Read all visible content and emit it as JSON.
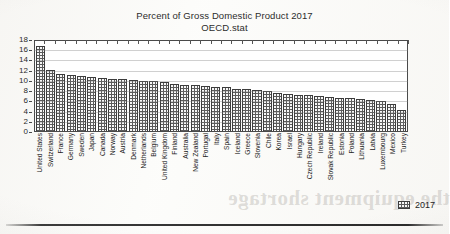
{
  "chart_data": {
    "type": "bar",
    "title": "Percent of Gross Domestic Product 2017",
    "subtitle": "OECD.stat",
    "xlabel": "",
    "ylabel": "",
    "ylim": [
      0,
      18
    ],
    "ytick_step": 2,
    "yticks": [
      18,
      16,
      14,
      12,
      10,
      8,
      6,
      4,
      2,
      0
    ],
    "grid": true,
    "legend": {
      "position": "bottom-right",
      "entries": [
        {
          "name": "2017",
          "color": "#5b5b5b",
          "pattern": "checkered"
        }
      ]
    },
    "categories": [
      "United States",
      "Switzerland",
      "France",
      "Germany",
      "Sweden",
      "Japan",
      "Canada",
      "Norway",
      "Austria",
      "Denmark",
      "Netherlands",
      "Belgium",
      "United Kingdom",
      "Finland",
      "Australia",
      "New Zealand",
      "Portugal",
      "Italy",
      "Spain",
      "Iceland",
      "Greece",
      "Slovenia",
      "Chile",
      "Korea",
      "Israel",
      "Hungary",
      "Czech Republic",
      "Ireland",
      "Slovak Republic",
      "Estonia",
      "Poland",
      "Lithuania",
      "Latvia",
      "Luxembourg",
      "Mexico",
      "Turkey"
    ],
    "series": [
      {
        "name": "2017",
        "values": [
          17.1,
          12.3,
          11.5,
          11.2,
          11.0,
          10.9,
          10.6,
          10.4,
          10.4,
          10.2,
          10.1,
          10.1,
          9.9,
          9.5,
          9.2,
          9.2,
          9.0,
          8.9,
          8.9,
          8.5,
          8.4,
          8.2,
          8.1,
          7.6,
          7.4,
          7.2,
          7.2,
          7.1,
          6.9,
          6.7,
          6.7,
          6.5,
          6.3,
          6.1,
          5.5,
          4.2
        ]
      }
    ]
  },
  "artifacts": {
    "bleed_text": "the equipment shortage"
  }
}
